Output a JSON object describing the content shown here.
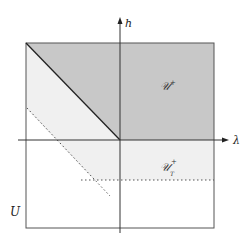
{
  "diagram": {
    "type": "phase-region-diagram",
    "axes": {
      "x_label": "λ",
      "y_label": "h"
    },
    "regions": [
      {
        "id": "U",
        "label": "U",
        "description": "outer square domain"
      },
      {
        "id": "U_plus",
        "label": "𝒰",
        "superscript": "+",
        "subscript": "",
        "fill": "#c8c8c8"
      },
      {
        "id": "U_T_plus",
        "label": "𝒰",
        "superscript": "+",
        "subscript": "T",
        "fill": "#f0f0f0"
      }
    ],
    "colors": {
      "dark_region": "#c8c8c8",
      "light_region": "#f0f0f0",
      "lines": "#333333",
      "border": "#555555"
    }
  }
}
